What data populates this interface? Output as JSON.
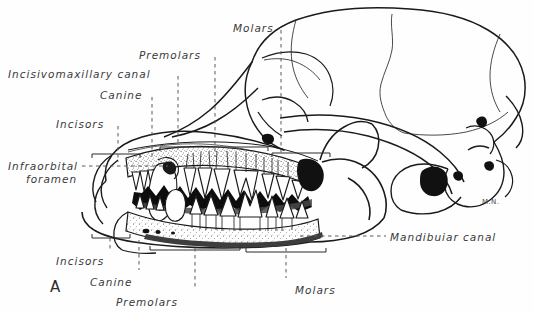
{
  "figure": {
    "letter": "A",
    "artist_initials": "M.N.",
    "background_color": "#fefefe",
    "ink_color": "#1a1a1a",
    "label_color": "#3a3a3a"
  },
  "labels": [
    {
      "name": "molars-top",
      "text": "Molars",
      "x": 233,
      "y": 22,
      "align": "left"
    },
    {
      "name": "premolars-top",
      "text": "Premolars",
      "x": 139,
      "y": 49,
      "align": "left"
    },
    {
      "name": "incisivomaxillary-canal",
      "text": "Incisivomaxillary canal",
      "x": 8,
      "y": 68,
      "align": "left"
    },
    {
      "name": "canine-top",
      "text": "Canine",
      "x": 100,
      "y": 89,
      "align": "left"
    },
    {
      "name": "incisors-top",
      "text": "Incisors",
      "x": 56,
      "y": 118,
      "align": "left"
    },
    {
      "name": "infraorbital-foramen-1",
      "text": "Infraorbital",
      "x": 8,
      "y": 160,
      "align": "left"
    },
    {
      "name": "infraorbital-foramen-2",
      "text": "foramen",
      "x": 26,
      "y": 173,
      "align": "left"
    },
    {
      "name": "mandibular-canal",
      "text": "Mandibuiar canal",
      "x": 390,
      "y": 231,
      "align": "left"
    },
    {
      "name": "incisors-bottom",
      "text": "Incisors",
      "x": 56,
      "y": 255,
      "align": "left"
    },
    {
      "name": "canine-bottom",
      "text": "Canine",
      "x": 90,
      "y": 276,
      "align": "left"
    },
    {
      "name": "premolars-bottom",
      "text": "Premolars",
      "x": 116,
      "y": 296,
      "align": "left"
    },
    {
      "name": "molars-bottom",
      "text": "Molars",
      "x": 295,
      "y": 284,
      "align": "left"
    }
  ],
  "leaders": [
    {
      "name": "leader-molars-top",
      "x1": 281,
      "y1": 30,
      "x2": 281,
      "y2": 158
    },
    {
      "name": "leader-premolars-top",
      "x1": 215,
      "y1": 57,
      "x2": 215,
      "y2": 157
    },
    {
      "name": "leader-canine-top",
      "x1": 152,
      "y1": 97,
      "x2": 152,
      "y2": 160
    },
    {
      "name": "leader-incisors-top",
      "x1": 118,
      "y1": 126,
      "x2": 118,
      "y2": 162
    },
    {
      "name": "leader-incisivomax",
      "x1": 178,
      "y1": 76,
      "x2": 178,
      "y2": 150
    },
    {
      "name": "leader-infraorbital",
      "x1": 82,
      "y1": 166,
      "x2": 168,
      "y2": 166
    },
    {
      "name": "leader-mandibular",
      "x1": 300,
      "y1": 236,
      "x2": 386,
      "y2": 236
    },
    {
      "name": "leader-incisors-bottom",
      "x1": 110,
      "y1": 238,
      "x2": 110,
      "y2": 249
    },
    {
      "name": "leader-canine-bottom",
      "x1": 139,
      "y1": 240,
      "x2": 139,
      "y2": 270
    },
    {
      "name": "leader-premolars-bottom",
      "x1": 195,
      "y1": 248,
      "x2": 195,
      "y2": 290
    },
    {
      "name": "leader-molars-bottom",
      "x1": 286,
      "y1": 248,
      "x2": 286,
      "y2": 278
    }
  ],
  "structures": [
    {
      "name": "cranium",
      "description": "braincase outline with suture lines"
    },
    {
      "name": "zygomatic-arch",
      "description": "cheek bone arch"
    },
    {
      "name": "maxilla-cutaway",
      "description": "sectioned upper jaw showing tooth roots in stippled bone"
    },
    {
      "name": "mandible-cutaway",
      "description": "sectioned lower jaw showing tooth roots in stippled bone"
    },
    {
      "name": "upper-teeth",
      "description": "incisors, canine, premolars, molars of upper arcade"
    },
    {
      "name": "lower-teeth",
      "description": "incisors, canine, premolars, molars of lower arcade"
    },
    {
      "name": "oral-cavity",
      "description": "black interdigitating space between tooth crowns"
    },
    {
      "name": "auditory-meatus",
      "description": "black ear opening at skull base"
    },
    {
      "name": "occipital-condyle",
      "description": "posterior articulation of skull"
    }
  ]
}
